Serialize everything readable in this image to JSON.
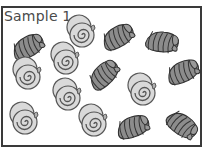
{
  "title": "Sample 1",
  "colors": {
    "border": "#3a3a3a",
    "spiral_fill": "#d9d9d9",
    "spiral_stroke": "#555555",
    "striped_fill": "#8c8c8c",
    "striped_stroke": "#333333"
  },
  "shells": [
    {
      "type": "striped",
      "x": 28,
      "y": 47,
      "rot": -25
    },
    {
      "type": "spiral",
      "x": 82,
      "y": 35,
      "rot": 0
    },
    {
      "type": "striped",
      "x": 118,
      "y": 37,
      "rot": -25
    },
    {
      "type": "striped",
      "x": 162,
      "y": 42,
      "rot": 10
    },
    {
      "type": "spiral",
      "x": 66,
      "y": 62,
      "rot": 0
    },
    {
      "type": "striped",
      "x": 104,
      "y": 75,
      "rot": -40
    },
    {
      "type": "striped",
      "x": 183,
      "y": 72,
      "rot": -20
    },
    {
      "type": "spiral",
      "x": 28,
      "y": 77,
      "rot": 0
    },
    {
      "type": "spiral",
      "x": 68,
      "y": 98,
      "rot": 0
    },
    {
      "type": "spiral",
      "x": 143,
      "y": 93,
      "rot": 0
    },
    {
      "type": "spiral",
      "x": 25,
      "y": 122,
      "rot": 0
    },
    {
      "type": "spiral",
      "x": 94,
      "y": 124,
      "rot": 0
    },
    {
      "type": "striped",
      "x": 133,
      "y": 127,
      "rot": -15
    },
    {
      "type": "striped",
      "x": 182,
      "y": 125,
      "rot": 40
    }
  ],
  "counts": {
    "spiral": 7,
    "striped": 7
  }
}
